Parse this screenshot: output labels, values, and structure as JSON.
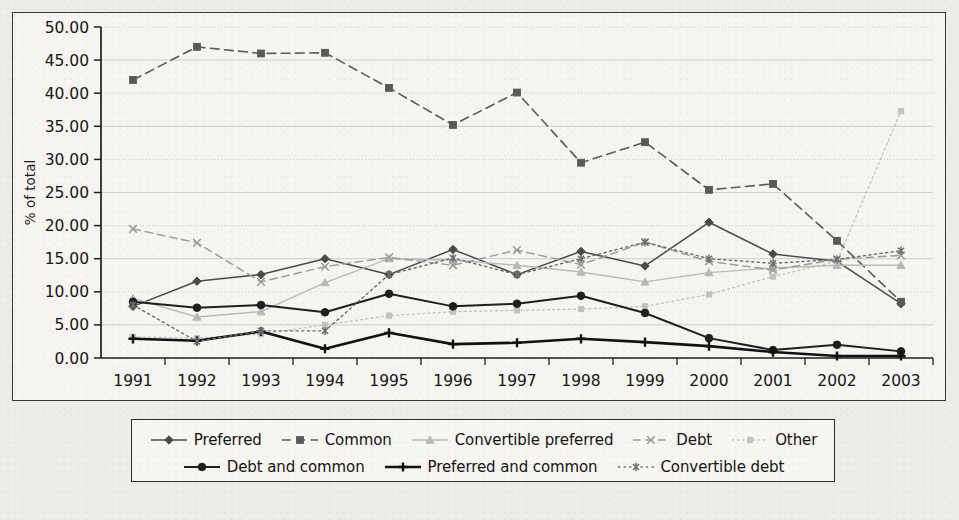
{
  "figure": {
    "background": "#eeece8",
    "plot_background": "#f6f5f2",
    "frame_color": "#3a3a3a"
  },
  "chart_data": {
    "type": "line",
    "title": "",
    "xlabel": "",
    "ylabel": "% of total",
    "ylim": [
      0,
      50
    ],
    "ytick_step": 5,
    "grid": true,
    "legend_position": "bottom",
    "categories": [
      "1991",
      "1992",
      "1993",
      "1994",
      "1995",
      "1996",
      "1997",
      "1998",
      "1999",
      "2000",
      "2001",
      "2002",
      "2003"
    ],
    "yticks": [
      "0.00",
      "5.00",
      "10.00",
      "15.00",
      "20.00",
      "25.00",
      "30.00",
      "35.00",
      "40.00",
      "45.00",
      "50.00"
    ],
    "series": [
      {
        "name": "Preferred",
        "marker": "diamond",
        "dash": "none",
        "color": "#4a4a4a",
        "width": 1.5,
        "values": [
          7.8,
          11.6,
          12.6,
          15.0,
          12.6,
          16.4,
          12.6,
          16.1,
          13.9,
          20.5,
          15.7,
          14.6,
          8.2
        ]
      },
      {
        "name": "Common",
        "marker": "square",
        "dash": "dashed",
        "color": "#5a5a5a",
        "width": 1.6,
        "values": [
          42.0,
          47.0,
          46.0,
          46.1,
          40.8,
          35.2,
          40.1,
          29.5,
          32.6,
          25.4,
          26.3,
          17.7,
          8.5
        ]
      },
      {
        "name": "Convertible preferred",
        "marker": "triangle",
        "dash": "none",
        "color": "#b9b9b9",
        "width": 1.4,
        "values": [
          9.0,
          6.2,
          7.0,
          11.4,
          15.0,
          14.8,
          14.0,
          13.0,
          11.5,
          12.9,
          13.6,
          14.0,
          14.0
        ]
      },
      {
        "name": "Debt",
        "marker": "cross",
        "dash": "dashed",
        "color": "#9a9a9a",
        "width": 1.4,
        "values": [
          19.5,
          17.4,
          11.5,
          13.8,
          15.2,
          14.0,
          16.3,
          14.1,
          17.5,
          14.6,
          13.3,
          14.9,
          15.5
        ]
      },
      {
        "name": "Other",
        "marker": "smallsquare",
        "dash": "dotted",
        "color": "#c2c2c2",
        "width": 1.3,
        "values": [
          3.2,
          3.0,
          3.6,
          5.0,
          6.4,
          7.0,
          7.2,
          7.4,
          7.8,
          9.6,
          12.3,
          14.6,
          37.3
        ]
      },
      {
        "name": "Debt and common",
        "marker": "circle",
        "dash": "none",
        "color": "#1f1f1f",
        "width": 2.0,
        "values": [
          8.5,
          7.6,
          8.0,
          6.9,
          9.7,
          7.8,
          8.2,
          9.4,
          6.8,
          3.0,
          1.2,
          2.0,
          1.0
        ]
      },
      {
        "name": "Preferred and common",
        "marker": "plus",
        "dash": "none",
        "color": "#111111",
        "width": 2.6,
        "values": [
          2.9,
          2.6,
          4.0,
          1.4,
          3.8,
          2.1,
          2.3,
          2.9,
          2.4,
          1.8,
          0.9,
          0.3,
          0.3
        ]
      },
      {
        "name": "Convertible debt",
        "marker": "asterisk",
        "dash": "dotted",
        "color": "#6d6d6d",
        "width": 1.4,
        "values": [
          8.0,
          2.5,
          4.1,
          4.1,
          12.6,
          15.1,
          12.6,
          15.0,
          17.5,
          15.0,
          14.3,
          14.9,
          16.2
        ]
      }
    ]
  },
  "legend": {
    "rows": [
      [
        "Preferred",
        "Common",
        "Convertible preferred",
        "Debt",
        "Other"
      ],
      [
        "Debt and common",
        "Preferred and common",
        "Convertible debt"
      ]
    ]
  }
}
